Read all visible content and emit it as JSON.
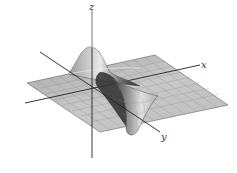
{
  "figure": {
    "axes": {
      "x_label": "x",
      "y_label": "y",
      "z_label": "z"
    },
    "colors": {
      "background": "#ffffff",
      "surface_light": "#e6e6e6",
      "surface_mid": "#b8b8b8",
      "surface_dark": "#3a3a3a",
      "grid": "#8c8c8c",
      "axis": "#222222"
    }
  }
}
